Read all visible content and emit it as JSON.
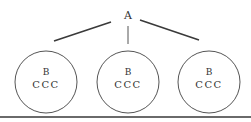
{
  "diagram": {
    "root": {
      "label": "A"
    },
    "children": [
      {
        "label": "B",
        "sub": "CCC"
      },
      {
        "label": "B",
        "sub": "CCC"
      },
      {
        "label": "B",
        "sub": "CCC"
      }
    ]
  },
  "colors": {
    "line": "#3a3a3a",
    "circle": "#555555",
    "rule": "#6a6a6a"
  }
}
